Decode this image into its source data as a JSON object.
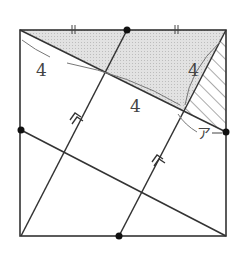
{
  "diagram": {
    "type": "geometry-square-figure",
    "labels": {
      "length_top_left": "4",
      "length_middle": "4",
      "length_right": "4",
      "angle_label": "ア"
    },
    "tick_marks": "||",
    "parallel_marks": "double-arrow",
    "colors": {
      "line": "#333333",
      "shaded_fill": "#d9d9d9",
      "hatch": "#555555",
      "arc": "#777777",
      "dot": "#111111"
    }
  }
}
